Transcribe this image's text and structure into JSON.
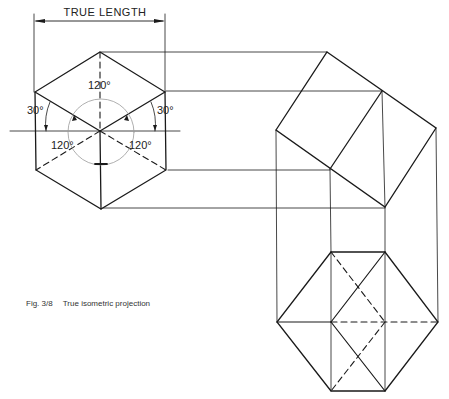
{
  "diagram": {
    "dimension_label": "TRUE LENGTH",
    "angles": {
      "top": "120°",
      "left_30": "30°",
      "right_30": "30°",
      "lower_left": "120°",
      "lower_right": "120°"
    },
    "caption": {
      "figure_number": "Fig. 3/8",
      "text": "True isometric projection"
    },
    "views": [
      {
        "name": "Isometric hexagon view",
        "position": "top-left"
      },
      {
        "name": "Rotated cube side view",
        "position": "top-right"
      },
      {
        "name": "Projected hexagon view",
        "position": "bottom-right"
      }
    ],
    "colors": {
      "line": "#1a1a1a",
      "construction_circle": "#9a9a9a",
      "background": "#ffffff"
    }
  }
}
